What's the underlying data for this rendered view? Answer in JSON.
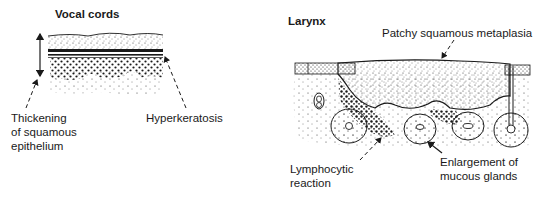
{
  "panels": [
    {
      "title": "Vocal cords",
      "labels": {
        "thickening": "Thickening\nof squamous\nepithelium",
        "hyperkeratosis": "Hyperkeratosis"
      }
    },
    {
      "title": "Larynx",
      "labels": {
        "metaplasia": "Patchy squamous metaplasia",
        "lymphocytic": "Lymphocytic\nreaction",
        "glands": "Enlargement of\nmucous glands"
      }
    }
  ],
  "colors": {
    "ink": "#1a1a1a",
    "background": "#ffffff"
  }
}
